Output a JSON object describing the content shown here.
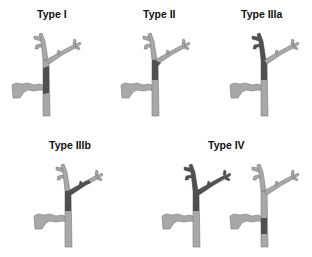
{
  "figure": {
    "colors": {
      "normal": "#a8a8a8",
      "stricture": "#505050",
      "outline": "#7a7a7a",
      "background": "#ffffff"
    }
  },
  "panels": [
    {
      "id": "type-1",
      "title": "Type I",
      "stricture": "common hepatic duct below confluence"
    },
    {
      "id": "type-2",
      "title": "Type II",
      "stricture": "confluence of hepatic ducts"
    },
    {
      "id": "type-3a",
      "title": "Type IIIa",
      "stricture": "confluence extending to right hepatic duct"
    },
    {
      "id": "type-3b",
      "title": "Type IIIb",
      "stricture": "confluence extending to left hepatic duct"
    },
    {
      "id": "type-4",
      "title": "Type IV",
      "stricture": "multifocal / both hepatic ducts"
    }
  ]
}
